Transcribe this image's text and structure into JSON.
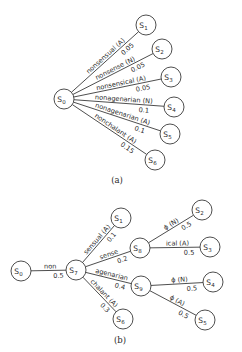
{
  "diagrams": [
    {
      "id": "a",
      "caption": "(a)",
      "caption_pos": [
        117,
        183
      ],
      "nodes": [
        {
          "id": "S0",
          "base": "S",
          "sub": "0",
          "x": 64,
          "y": 99
        },
        {
          "id": "S1",
          "base": "S",
          "sub": "1",
          "x": 146,
          "y": 25
        },
        {
          "id": "S2",
          "base": "S",
          "sub": "2",
          "x": 162,
          "y": 49
        },
        {
          "id": "S3",
          "base": "S",
          "sub": "3",
          "x": 171,
          "y": 77
        },
        {
          "id": "S4",
          "base": "S",
          "sub": "4",
          "x": 174,
          "y": 107
        },
        {
          "id": "S5",
          "base": "S",
          "sub": "5",
          "x": 170,
          "y": 134
        },
        {
          "id": "S6",
          "base": "S",
          "sub": "6",
          "x": 155,
          "y": 160
        }
      ],
      "edges": [
        {
          "from": "S0",
          "to": "S1",
          "label": "nonsensual (A)",
          "prob": "0.05"
        },
        {
          "from": "S0",
          "to": "S2",
          "label": "nonsense (N)",
          "prob": "0.05"
        },
        {
          "from": "S0",
          "to": "S3",
          "label": "nonsensical (A)",
          "prob": "0.05"
        },
        {
          "from": "S0",
          "to": "S4",
          "label": "nonagenarian (N)",
          "prob": "0.1"
        },
        {
          "from": "S0",
          "to": "S5",
          "label": "nonagenarian (A)",
          "prob": "0.1"
        },
        {
          "from": "S0",
          "to": "S6",
          "label": "nonchalant (A)",
          "prob": "0.15"
        }
      ]
    },
    {
      "id": "b",
      "caption": "(b)",
      "caption_pos": [
        120,
        343
      ],
      "nodes": [
        {
          "id": "S0",
          "base": "S",
          "sub": "0",
          "x": 21,
          "y": 271
        },
        {
          "id": "S7",
          "base": "S",
          "sub": "7",
          "x": 76,
          "y": 270
        },
        {
          "id": "S1",
          "base": "S",
          "sub": "1",
          "x": 121,
          "y": 218
        },
        {
          "id": "S8",
          "base": "S",
          "sub": "8",
          "x": 140,
          "y": 248
        },
        {
          "id": "S2",
          "base": "S",
          "sub": "2",
          "x": 202,
          "y": 210
        },
        {
          "id": "S3",
          "base": "S",
          "sub": "3",
          "x": 210,
          "y": 247
        },
        {
          "id": "S9",
          "base": "S",
          "sub": "9",
          "x": 141,
          "y": 286
        },
        {
          "id": "S4",
          "base": "S",
          "sub": "4",
          "x": 213,
          "y": 282
        },
        {
          "id": "S5",
          "base": "S",
          "sub": "5",
          "x": 205,
          "y": 320
        },
        {
          "id": "S6",
          "base": "S",
          "sub": "6",
          "x": 123,
          "y": 319
        }
      ],
      "edges": [
        {
          "from": "S0",
          "to": "S7",
          "label": "non",
          "prob": "0.5"
        },
        {
          "from": "S7",
          "to": "S1",
          "label": "sensual (A)",
          "prob": "0.1"
        },
        {
          "from": "S7",
          "to": "S8",
          "label": "sense",
          "prob": "0.2"
        },
        {
          "from": "S7",
          "to": "S9",
          "label": "agenarian",
          "prob": "0.4"
        },
        {
          "from": "S7",
          "to": "S6",
          "label": "chalant (A)",
          "prob": "0.3"
        },
        {
          "from": "S8",
          "to": "S2",
          "label": "ϕ (N)",
          "prob": "0.5"
        },
        {
          "from": "S8",
          "to": "S3",
          "label": "ical (A)",
          "prob": "0.5"
        },
        {
          "from": "S9",
          "to": "S4",
          "label": "ϕ (N)",
          "prob": "0.5"
        },
        {
          "from": "S9",
          "to": "S5",
          "label": "ϕ (A)",
          "prob": "0.5"
        }
      ]
    }
  ],
  "style": {
    "node_radius": 10,
    "stroke_color": "#3a3a3a",
    "text_color": "#2a2a2a",
    "background": "#ffffff"
  }
}
